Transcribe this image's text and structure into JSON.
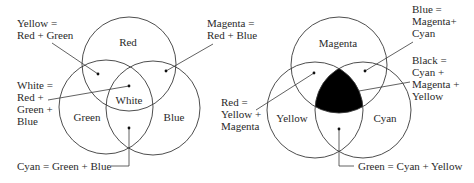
{
  "additive": {
    "regions": {
      "red": "Red",
      "green": "Green",
      "blue": "Blue",
      "white": "White"
    },
    "annotations": {
      "yellow": [
        "Yellow =",
        "Red + Green"
      ],
      "magenta": [
        "Magenta =",
        "Red + Blue"
      ],
      "white": [
        "White =",
        "Red +",
        "Green +",
        "Blue"
      ],
      "cyan": [
        "Cyan = Green + Blue"
      ]
    }
  },
  "subtractive": {
    "regions": {
      "magenta": "Magenta",
      "yellow": "Yellow",
      "cyan": "Cyan"
    },
    "annotations": {
      "blue": [
        "Blue =",
        "Magenta+",
        "Cyan"
      ],
      "black": [
        "Black =",
        "Cyan +",
        "Magenta +",
        "Yellow"
      ],
      "red": [
        "Red =",
        "Yellow +",
        "Magenta"
      ],
      "green": [
        "Green = Cyan + Yellow"
      ]
    }
  },
  "colors": {
    "stroke": "#3a3a3a",
    "text": "#2a2a2a",
    "black_region": "#000000",
    "background": "#ffffff"
  }
}
